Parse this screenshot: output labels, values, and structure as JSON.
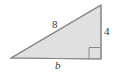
{
  "figure": {
    "name": "right-triangle",
    "background_color": "#ffffff",
    "fill_color": "#e0e0e0",
    "stroke_color": "#8a8a8a",
    "label_color": "#3b3b3b",
    "vertices": {
      "apex_top_right": [
        101,
        5
      ],
      "corner_bottom_right": [
        101,
        59
      ],
      "corner_bottom_left": [
        11,
        58
      ]
    },
    "right_angle_marker": {
      "name": "right-angle-square",
      "x": 89,
      "y": 47,
      "size": 12
    },
    "labels": {
      "hypotenuse": "8",
      "vertical_leg": "4",
      "base": "b"
    }
  }
}
